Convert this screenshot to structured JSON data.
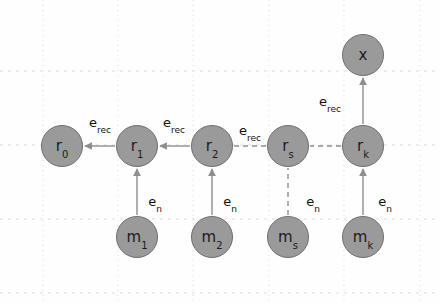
{
  "figure": {
    "background_color": "#fefefe",
    "node_fill": "#9a9a9a",
    "node_stroke": "#6f6f6f",
    "edge_color": "#8e8e8e",
    "text_color": "#111111",
    "grid_color": "#dddde4"
  },
  "grid": {
    "visible": true,
    "style": "dotted",
    "vertical_lines_x": [
      43,
      118,
      193,
      269,
      344,
      420
    ],
    "horizontal_lines_y": [
      71,
      145,
      219,
      293
    ]
  },
  "nodes": [
    {
      "id": "r0",
      "base": "r",
      "sub": "0",
      "cx": 62,
      "cy": 146,
      "r": 21,
      "row": "recurrent"
    },
    {
      "id": "r1",
      "base": "r",
      "sub": "1",
      "cx": 137,
      "cy": 146,
      "r": 21,
      "row": "recurrent"
    },
    {
      "id": "r2",
      "base": "r",
      "sub": "2",
      "cx": 212,
      "cy": 146,
      "r": 21,
      "row": "recurrent"
    },
    {
      "id": "rs",
      "base": "r",
      "sub": "s",
      "cx": 288,
      "cy": 146,
      "r": 21,
      "row": "recurrent"
    },
    {
      "id": "rk",
      "base": "r",
      "sub": "k",
      "cx": 363,
      "cy": 146,
      "r": 21,
      "row": "recurrent"
    },
    {
      "id": "m1",
      "base": "m",
      "sub": "1",
      "cx": 137,
      "cy": 237,
      "r": 21,
      "row": "message"
    },
    {
      "id": "m2",
      "base": "m",
      "sub": "2",
      "cx": 212,
      "cy": 237,
      "r": 21,
      "row": "message"
    },
    {
      "id": "ms",
      "base": "m",
      "sub": "s",
      "cx": 288,
      "cy": 237,
      "r": 21,
      "row": "message"
    },
    {
      "id": "mk",
      "base": "m",
      "sub": "k",
      "cx": 363,
      "cy": 237,
      "r": 21,
      "row": "message"
    },
    {
      "id": "x",
      "base": "x",
      "sub": "",
      "cx": 363,
      "cy": 55,
      "r": 21,
      "row": "output"
    }
  ],
  "edges": [
    {
      "id": "e-r1-r0",
      "from": "r1",
      "to": "r0",
      "style": "solid",
      "arrow": true,
      "label": "e_rec"
    },
    {
      "id": "e-r2-r1",
      "from": "r2",
      "to": "r1",
      "style": "solid",
      "arrow": true,
      "label": "e_rec"
    },
    {
      "id": "e-rs-r2",
      "from": "rs",
      "to": "r2",
      "style": "dashed",
      "arrow": false,
      "label": "e_rec"
    },
    {
      "id": "e-rk-rs",
      "from": "rk",
      "to": "rs",
      "style": "dashed",
      "arrow": false,
      "label": ""
    },
    {
      "id": "e-rk-x",
      "from": "rk",
      "to": "x",
      "style": "solid",
      "arrow": true,
      "label": "e_rec"
    },
    {
      "id": "e-m1-r1",
      "from": "m1",
      "to": "r1",
      "style": "solid",
      "arrow": true,
      "label": "e_n"
    },
    {
      "id": "e-m2-r2",
      "from": "m2",
      "to": "r2",
      "style": "solid",
      "arrow": true,
      "label": "e_n"
    },
    {
      "id": "e-ms-rs",
      "from": "ms",
      "to": "rs",
      "style": "dashed",
      "arrow": false,
      "label": "e_n"
    },
    {
      "id": "e-mk-rk",
      "from": "mk",
      "to": "rk",
      "style": "solid",
      "arrow": true,
      "label": "e_n"
    }
  ],
  "edge_labels": [
    {
      "id": "lbl-erec-r1r0",
      "base": "e",
      "sub": "rec",
      "x": 100,
      "y": 122,
      "for_edge": "e-r1-r0"
    },
    {
      "id": "lbl-erec-r2r1",
      "base": "e",
      "sub": "rec",
      "x": 174,
      "y": 122,
      "for_edge": "e-r2-r1"
    },
    {
      "id": "lbl-erec-rsr2",
      "base": "e",
      "sub": "rec",
      "x": 250,
      "y": 130,
      "for_edge": "e-rs-r2"
    },
    {
      "id": "lbl-erec-rkx",
      "base": "e",
      "sub": "rec",
      "x": 330,
      "y": 101,
      "for_edge": "e-rk-x"
    },
    {
      "id": "lbl-en-m1",
      "base": "e",
      "sub": "n",
      "x": 155,
      "y": 201,
      "for_edge": "e-m1-r1"
    },
    {
      "id": "lbl-en-m2",
      "base": "e",
      "sub": "n",
      "x": 230,
      "y": 201,
      "for_edge": "e-m2-r2"
    },
    {
      "id": "lbl-en-ms",
      "base": "e",
      "sub": "n",
      "x": 313,
      "y": 201,
      "for_edge": "e-ms-rs"
    },
    {
      "id": "lbl-en-mk",
      "base": "e",
      "sub": "n",
      "x": 385,
      "y": 201,
      "for_edge": "e-mk-rk"
    }
  ]
}
